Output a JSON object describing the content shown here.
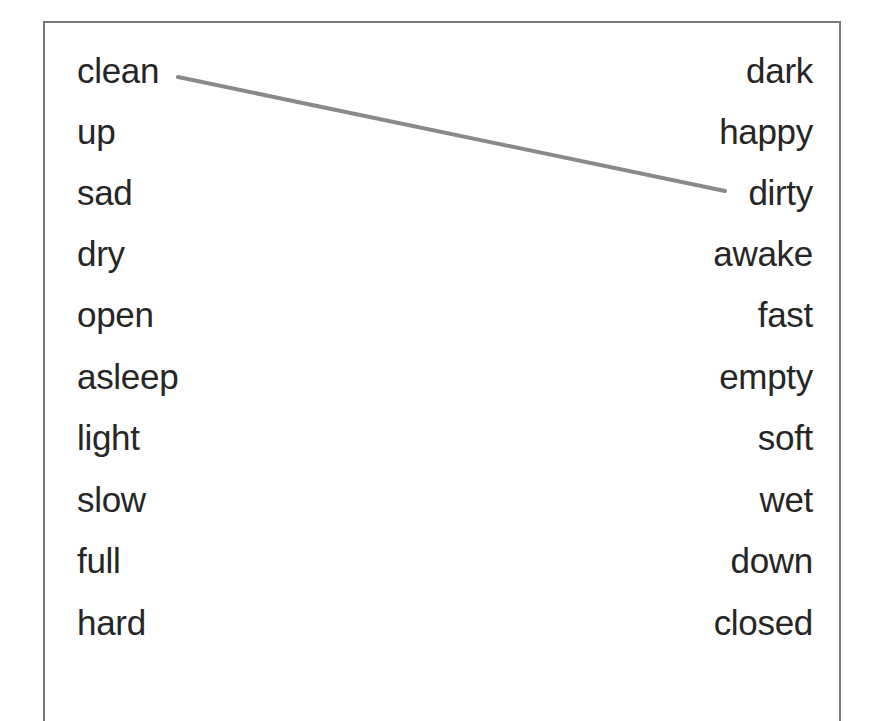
{
  "worksheet": {
    "left_column": [
      "clean",
      "up",
      "sad",
      "dry",
      "open",
      "asleep",
      "light",
      "slow",
      "full",
      "hard"
    ],
    "right_column": [
      "dark",
      "happy",
      "dirty",
      "awake",
      "fast",
      "empty",
      "soft",
      "wet",
      "down",
      "closed"
    ],
    "matches": [
      {
        "from": "clean",
        "to": "dirty"
      }
    ],
    "colors": {
      "text": "#262626",
      "border": "#7a7a7a",
      "connector_line": "#8a8a8a"
    }
  }
}
